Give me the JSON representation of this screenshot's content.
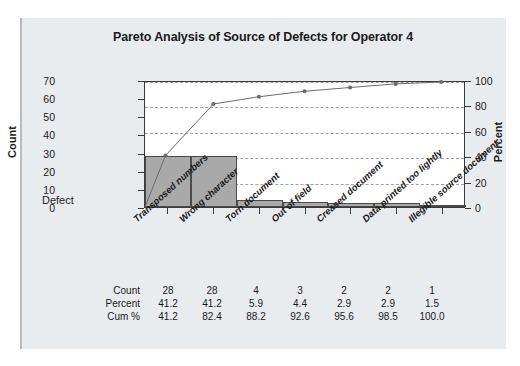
{
  "chart_data": {
    "type": "bar",
    "title": "Pareto Analysis of Source of Defects for Operator 4",
    "xlabel": "Defect",
    "ylabel": "Count",
    "y2label": "Percent",
    "ylim": [
      0,
      70
    ],
    "y2lim": [
      0,
      100
    ],
    "yticks": [
      70,
      60,
      50,
      40,
      30,
      20,
      10,
      0
    ],
    "y2ticks": [
      100,
      80,
      60,
      40,
      20,
      0
    ],
    "grid": "horizontal-dashed-right-axis",
    "legend": "none",
    "categories": [
      "Transposed numbers",
      "Wrong character",
      "Torn document",
      "Out of field",
      "Creased document",
      "Data printed too lightly",
      "Illegible source document"
    ],
    "series": [
      {
        "name": "Count",
        "type": "bar",
        "values": [
          28,
          28,
          4,
          3,
          2,
          2,
          1
        ]
      },
      {
        "name": "Cum %",
        "type": "line",
        "values": [
          41.2,
          82.4,
          88.2,
          92.6,
          95.6,
          98.5,
          100.0
        ]
      }
    ],
    "table": {
      "rows": [
        {
          "label": "Count",
          "values": [
            "28",
            "28",
            "4",
            "3",
            "2",
            "2",
            "1"
          ]
        },
        {
          "label": "Percent",
          "values": [
            "41.2",
            "41.2",
            "5.9",
            "4.4",
            "2.9",
            "2.9",
            "1.5"
          ]
        },
        {
          "label": "Cum %",
          "values": [
            "41.2",
            "82.4",
            "88.2",
            "92.6",
            "95.6",
            "98.5",
            "100.0"
          ]
        }
      ]
    },
    "colors": {
      "bar_fill": "#a9a9a9",
      "bar_edge": "#4a4a4a",
      "line": "#6b6b6b",
      "grid": "#9aa0a6",
      "axis": "#3a3a3a",
      "panel_bg": "#e9ecef",
      "plot_bg": "#ffffff",
      "text": "#1a1a1a"
    }
  }
}
